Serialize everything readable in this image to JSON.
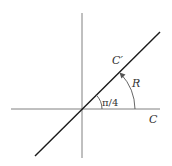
{
  "diagram": {
    "labels": {
      "contour_c": "C",
      "contour_c_prime": "C′",
      "rotation": "R",
      "angle": "π/4"
    },
    "colors": {
      "axes": "#808080",
      "line": "#1a1a1a",
      "arc": "#555555",
      "text": "#333333"
    },
    "geometry": {
      "origin": [
        82,
        109
      ],
      "angle_deg": 45,
      "small_arc_radius": 20,
      "large_arc_radius": 53
    }
  }
}
